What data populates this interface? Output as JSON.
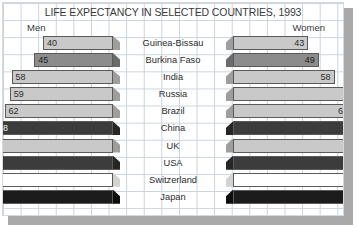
{
  "chart": {
    "title": "LIFE EXPECTANCY IN SELECTED COUNTRIES, 1993",
    "left_label": "Men",
    "right_label": "Women"
  },
  "chart_data": {
    "type": "bar",
    "title": "LIFE EXPECTANCY IN SELECTED COUNTRIES, 1993",
    "xlabel": "",
    "ylabel": "",
    "orientation": "horizontal-pyramid",
    "grid": true,
    "legend_position": "inline-top",
    "categories": [
      "Guinea-Bissau",
      "Burkina Faso",
      "India",
      "Russia",
      "Brazil",
      "China",
      "UK",
      "USA",
      "Switzerland",
      "Japan"
    ],
    "series": [
      {
        "name": "Men",
        "values": [
          40,
          45,
          58,
          59,
          62,
          68,
          72,
          72,
          74,
          75
        ]
      },
      {
        "name": "Women",
        "values": [
          43,
          49,
          58,
          72,
          68,
          71,
          78,
          79,
          81,
          78
        ]
      }
    ],
    "units": "years",
    "xlim": [
      0,
      85
    ]
  },
  "rows": [
    {
      "country": "Guinea-Bissau",
      "men": 40,
      "women": 43,
      "tone": "light"
    },
    {
      "country": "Burkina Faso",
      "men": 45,
      "women": 49,
      "tone": "mid"
    },
    {
      "country": "India",
      "men": 58,
      "women": 58,
      "tone": "light"
    },
    {
      "country": "Russia",
      "men": 59,
      "women": 72,
      "tone": "light"
    },
    {
      "country": "Brazil",
      "men": 62,
      "women": 68,
      "tone": "light"
    },
    {
      "country": "China",
      "men": 68,
      "women": 71,
      "tone": "dark"
    },
    {
      "country": "UK",
      "men": 72,
      "women": 78,
      "tone": "light"
    },
    {
      "country": "USA",
      "men": 72,
      "women": 79,
      "tone": "dark"
    },
    {
      "country": "Switzerland",
      "men": 74,
      "women": 81,
      "tone": "white"
    },
    {
      "country": "Japan",
      "men": 75,
      "women": 78,
      "tone": "black"
    }
  ]
}
